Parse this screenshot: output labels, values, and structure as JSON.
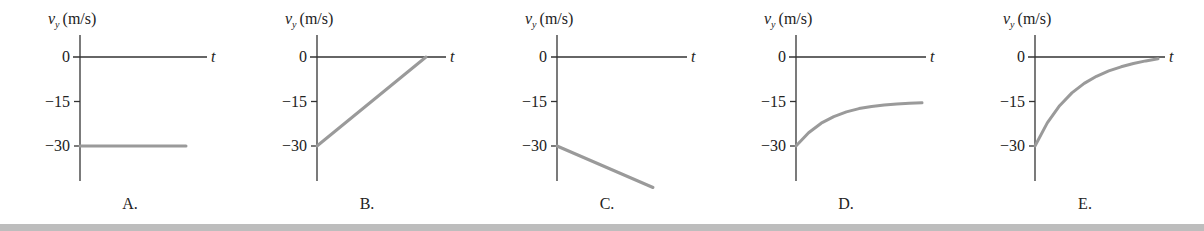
{
  "chart_data": [
    {
      "type": "line",
      "panel_label": "A.",
      "title": "",
      "ylabel_var": "v",
      "ylabel_sub": "y",
      "ylabel_unit": "(m/s)",
      "xlabel": "t",
      "yticks": [
        0,
        -15,
        -30
      ],
      "ytick_labels": [
        "0",
        "−15",
        "−30"
      ],
      "ylim": [
        -40,
        8
      ],
      "grid": false,
      "description": "constant velocity at -30 m/s",
      "points": [
        [
          0,
          -30
        ],
        [
          1,
          -30
        ]
      ]
    },
    {
      "type": "line",
      "panel_label": "B.",
      "title": "",
      "ylabel_var": "v",
      "ylabel_sub": "y",
      "ylabel_unit": "(m/s)",
      "xlabel": "t",
      "yticks": [
        0,
        -15,
        -30
      ],
      "ytick_labels": [
        "0",
        "−15",
        "−30"
      ],
      "ylim": [
        -40,
        8
      ],
      "grid": false,
      "description": "linear increase from -30 to 0 m/s",
      "points": [
        [
          0,
          -30
        ],
        [
          1,
          0
        ]
      ]
    },
    {
      "type": "line",
      "panel_label": "C.",
      "title": "",
      "ylabel_var": "v",
      "ylabel_sub": "y",
      "ylabel_unit": "(m/s)",
      "xlabel": "t",
      "yticks": [
        0,
        -15,
        -30
      ],
      "ytick_labels": [
        "0",
        "−15",
        "−30"
      ],
      "ylim": [
        -40,
        8
      ],
      "grid": false,
      "description": "linear decrease from -30 to about -44 m/s",
      "points": [
        [
          0,
          -30
        ],
        [
          0.88,
          -44
        ]
      ]
    },
    {
      "type": "line",
      "panel_label": "D.",
      "title": "",
      "ylabel_var": "v",
      "ylabel_sub": "y",
      "ylabel_unit": "(m/s)",
      "xlabel": "t",
      "yticks": [
        0,
        -15,
        -30
      ],
      "ytick_labels": [
        "0",
        "−15",
        "−30"
      ],
      "ylim": [
        -40,
        8
      ],
      "grid": false,
      "description": "exponential approach from -30 toward -15 m/s (terminal velocity)",
      "points": [
        [
          0,
          -30
        ],
        [
          0.1,
          -25.5
        ],
        [
          0.2,
          -22.3
        ],
        [
          0.3,
          -20.1
        ],
        [
          0.4,
          -18.5
        ],
        [
          0.5,
          -17.4
        ],
        [
          0.6,
          -16.7
        ],
        [
          0.7,
          -16.2
        ],
        [
          0.8,
          -15.8
        ],
        [
          0.9,
          -15.6
        ],
        [
          1.0,
          -15.4
        ]
      ]
    },
    {
      "type": "line",
      "panel_label": "E.",
      "title": "",
      "ylabel_var": "v",
      "ylabel_sub": "y",
      "ylabel_unit": "(m/s)",
      "xlabel": "t",
      "yticks": [
        0,
        -15,
        -30
      ],
      "ytick_labels": [
        "0",
        "−15",
        "−30"
      ],
      "ylim": [
        -40,
        8
      ],
      "grid": false,
      "description": "exponential approach from -30 toward 0 m/s",
      "points": [
        [
          0,
          -30
        ],
        [
          0.1,
          -22.2
        ],
        [
          0.2,
          -16.4
        ],
        [
          0.3,
          -12.1
        ],
        [
          0.4,
          -8.9
        ],
        [
          0.5,
          -6.5
        ],
        [
          0.6,
          -4.7
        ],
        [
          0.7,
          -3.3
        ],
        [
          0.8,
          -2.2
        ],
        [
          0.9,
          -1.3
        ],
        [
          1.0,
          -0.6
        ]
      ]
    }
  ],
  "panels": [
    {
      "x0": 80,
      "xend": 186,
      "axis_left": 73,
      "axis_right": 207
    },
    {
      "x0": 317,
      "xend": 426,
      "axis_left": 310,
      "axis_right": 446
    },
    {
      "x0": 557,
      "xend": 653,
      "axis_left": 551,
      "axis_right": 687
    },
    {
      "x0": 796,
      "xend": 922,
      "axis_left": 789,
      "axis_right": 926
    },
    {
      "x0": 1035,
      "xend": 1158,
      "axis_left": 1028,
      "axis_right": 1165
    }
  ],
  "style": {
    "axis_color": "#333333",
    "data_color": "#9a9a9a",
    "bar_color": "#bdbdbd"
  }
}
